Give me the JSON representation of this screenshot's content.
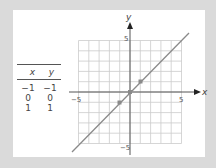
{
  "table": {
    "headers": [
      "x",
      "y"
    ],
    "rows": [
      [
        "−1",
        "−1"
      ],
      [
        "0",
        "0"
      ],
      [
        "1",
        "1"
      ]
    ]
  },
  "graph": {
    "x_axis_label": "x",
    "y_axis_label": "y",
    "tick_labels": {
      "x_neg": "−5",
      "x_pos": "5",
      "y_pos": "5",
      "y_neg": "−5"
    },
    "line_color": "#888888",
    "grid_color": "#cccccc"
  },
  "chart_data": {
    "type": "line",
    "title": "",
    "xlabel": "x",
    "ylabel": "y",
    "xlim": [
      -5,
      5
    ],
    "ylim": [
      -5,
      5
    ],
    "grid": true,
    "series": [
      {
        "name": "y = x",
        "x": [
          -5.5,
          5.5
        ],
        "y": [
          -5.5,
          5.5
        ]
      },
      {
        "name": "points",
        "x": [
          -1,
          0,
          1
        ],
        "y": [
          -1,
          0,
          1
        ]
      }
    ],
    "table": {
      "columns": [
        "x",
        "y"
      ],
      "rows": [
        [
          -1,
          -1
        ],
        [
          0,
          0
        ],
        [
          1,
          1
        ]
      ]
    }
  }
}
